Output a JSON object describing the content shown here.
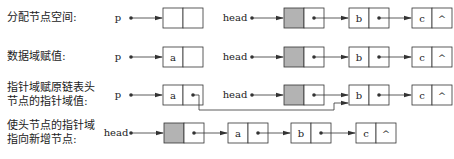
{
  "steps": [
    {
      "label": "分配节点空间:",
      "pointer": "p",
      "new_node": {
        "data": "",
        "next": ""
      },
      "list_head": "head",
      "list": [
        {
          "data": "",
          "next": "•",
          "header": true
        },
        {
          "data": "b",
          "next": "•"
        },
        {
          "data": "c",
          "next": "^"
        }
      ]
    },
    {
      "label": "数据域赋值:",
      "pointer": "p",
      "new_node": {
        "data": "a",
        "next": ""
      },
      "list_head": "head",
      "list": [
        {
          "data": "",
          "next": "•",
          "header": true
        },
        {
          "data": "b",
          "next": "•"
        },
        {
          "data": "c",
          "next": "^"
        }
      ]
    },
    {
      "label": "指针域赋原链表头\n节点的指针域值:",
      "pointer": "p",
      "new_node": {
        "data": "a",
        "next": "•"
      },
      "list_head": "head",
      "list": [
        {
          "data": "",
          "next": "•",
          "header": true
        },
        {
          "data": "b",
          "next": "•"
        },
        {
          "data": "c",
          "next": "^"
        }
      ]
    },
    {
      "label": "使头节点的指针域\n指向新增节点:",
      "pointer": "head",
      "list": [
        {
          "data": "",
          "next": "•",
          "header": true
        },
        {
          "data": "a",
          "next": "•"
        },
        {
          "data": "b",
          "next": "•"
        },
        {
          "data": "c",
          "next": "^"
        }
      ]
    }
  ],
  "colors": {
    "header_fill": "#b3b3b3",
    "line": "#333333"
  }
}
